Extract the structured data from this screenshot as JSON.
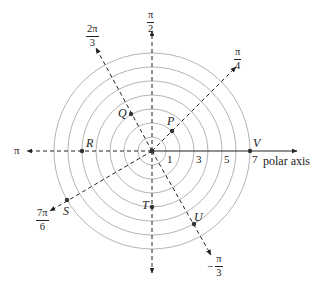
{
  "diagram": {
    "type": "polar-coordinate-plot",
    "center": {
      "x": 152,
      "y": 151
    },
    "unit_px": 14,
    "circles": {
      "radii": [
        1,
        2,
        3,
        4,
        5,
        6,
        7
      ],
      "color": "#aaaaaa"
    },
    "axes": [
      {
        "name": "polar-axis",
        "angle": "0",
        "style": "solid",
        "label": "polar axis"
      },
      {
        "name": "pi-axis",
        "angle": "π",
        "style": "dashed",
        "label": "π"
      },
      {
        "name": "pi-over-2-axis",
        "angle": "π/2",
        "style": "dashed",
        "label": {
          "num": "π",
          "den": "2"
        }
      },
      {
        "name": "pi-over-4-axis",
        "angle": "π/4",
        "style": "dashed",
        "label": {
          "num": "π",
          "den": "4"
        }
      },
      {
        "name": "2pi-over-3-axis",
        "angle": "2π/3",
        "style": "dashed",
        "label": {
          "num": "2π",
          "den": "3"
        }
      },
      {
        "name": "7pi-over-6-axis",
        "angle": "7π/6",
        "style": "dashed",
        "label": {
          "num": "7π",
          "den": "6"
        }
      },
      {
        "name": "neg-pi-over-3-axis",
        "angle": "−π/3",
        "style": "dashed",
        "label": {
          "sign": "−",
          "num": "π",
          "den": "3"
        }
      }
    ],
    "tick_labels": [
      "1",
      "3",
      "5",
      "7"
    ],
    "points": [
      {
        "name": "P",
        "r": 2,
        "theta": "π/4"
      },
      {
        "name": "Q",
        "r": 3,
        "theta": "2π/3"
      },
      {
        "name": "R",
        "r": 5,
        "theta": "π"
      },
      {
        "name": "S",
        "r": 7,
        "theta": "7π/6"
      },
      {
        "name": "T",
        "r": 4,
        "theta": "3π/2"
      },
      {
        "name": "U",
        "r": 6,
        "theta": "−π/3"
      },
      {
        "name": "V",
        "r": 7,
        "theta": "0"
      }
    ]
  }
}
